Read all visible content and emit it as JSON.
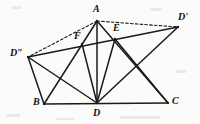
{
  "figure": {
    "background_color": "#fbfbfa",
    "stroke_color": "#1a1a1a",
    "canvas": {
      "width": 200,
      "height": 124
    },
    "points": {
      "A": {
        "label": "A",
        "x": 97,
        "y": 21,
        "label_x": 93,
        "label_y": 4
      },
      "B": {
        "label": "B",
        "x": 44,
        "y": 104,
        "label_x": 33,
        "label_y": 97
      },
      "C": {
        "label": "C",
        "x": 168,
        "y": 103,
        "label_x": 172,
        "label_y": 96
      },
      "D": {
        "label": "D",
        "x": 97,
        "y": 103,
        "label_x": 93,
        "label_y": 108
      },
      "E": {
        "label": "E",
        "x": 115,
        "y": 39,
        "label_x": 113,
        "label_y": 23
      },
      "F": {
        "label": "F",
        "x": 82,
        "y": 44,
        "label_x": 74,
        "label_y": 31
      },
      "Dp": {
        "label": "D'",
        "x": 178,
        "y": 27,
        "label_x": 178,
        "label_y": 12
      },
      "Dpp": {
        "label": "D″",
        "x": 28,
        "y": 57,
        "label_x": 10,
        "label_y": 48
      }
    },
    "segments_solid": [
      {
        "name": "segment-B-C",
        "from": "B",
        "to": "C"
      },
      {
        "name": "segment-A-B",
        "from": "A",
        "to": "B"
      },
      {
        "name": "segment-A-C",
        "from": "A",
        "to": "C"
      },
      {
        "name": "segment-A-D",
        "from": "A",
        "to": "D"
      },
      {
        "name": "segment-Dpp-Dp",
        "from": "Dpp",
        "to": "Dp"
      },
      {
        "name": "segment-Dpp-B",
        "from": "Dpp",
        "to": "B"
      },
      {
        "name": "segment-Dpp-D",
        "from": "Dpp",
        "to": "D"
      },
      {
        "name": "segment-D-F",
        "from": "D",
        "to": "F"
      },
      {
        "name": "segment-D-E",
        "from": "D",
        "to": "E"
      },
      {
        "name": "segment-D-Dp",
        "from": "D",
        "to": "Dp"
      },
      {
        "name": "segment-E-C",
        "from": "E",
        "to": "C"
      }
    ],
    "segments_dashed": [
      {
        "name": "segment-A-Dp",
        "from": "A",
        "to": "Dp"
      },
      {
        "name": "segment-A-Dpp",
        "from": "A",
        "to": "Dpp"
      }
    ]
  }
}
